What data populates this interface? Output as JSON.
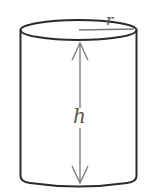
{
  "diagram": {
    "type": "cylinder",
    "labels": {
      "radius": "r",
      "height": "h"
    },
    "colors": {
      "outline": "#2a2a2a",
      "annotation": "#777777",
      "label": "#555555"
    }
  }
}
